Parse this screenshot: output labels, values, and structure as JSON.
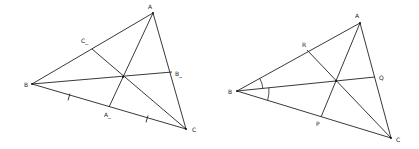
{
  "figures": [
    {
      "name": "medians-triangle",
      "vertices": {
        "A": {
          "label": "A",
          "x": 153,
          "y": 13,
          "lx": 148,
          "ly": 9
        },
        "B": {
          "label": "B",
          "x": 32,
          "y": 84,
          "lx": 24,
          "ly": 87
        },
        "C": {
          "label": "C",
          "x": 186,
          "y": 129,
          "lx": 192,
          "ly": 132
        }
      },
      "feet": {
        "A_": {
          "label": "A_",
          "x": 109,
          "y": 107,
          "lx": 104,
          "ly": 117
        },
        "B_": {
          "label": "B_",
          "x": 172,
          "y": 72,
          "lx": 175,
          "ly": 76
        },
        "C_": {
          "label": "C_",
          "x": 92,
          "y": 49,
          "lx": 81,
          "ly": 43
        }
      },
      "center": {
        "x": 123,
        "y": 77
      },
      "tick_marks": [
        {
          "x": 69,
          "y": 97
        },
        {
          "x": 147,
          "y": 119
        }
      ]
    },
    {
      "name": "angle-bisectors-triangle",
      "vertices": {
        "A": {
          "label": "A",
          "x": 360,
          "y": 23,
          "lx": 355,
          "ly": 18
        },
        "B": {
          "label": "B",
          "x": 237,
          "y": 91,
          "lx": 228,
          "ly": 94
        },
        "C": {
          "label": "C",
          "x": 391,
          "y": 138,
          "lx": 396,
          "ly": 142
        }
      },
      "feet": {
        "P": {
          "label": "P",
          "x": 321,
          "y": 117,
          "lx": 316,
          "ly": 126
        },
        "Q": {
          "label": "Q",
          "x": 375,
          "y": 77,
          "lx": 379,
          "ly": 80
        },
        "R": {
          "label": "R",
          "x": 307,
          "y": 50,
          "lx": 302,
          "ly": 47
        }
      },
      "center": {
        "x": 336,
        "y": 81
      },
      "angle_arcs": [
        {
          "from": "BA",
          "to": "BQ",
          "radius": 26
        },
        {
          "from": "BQ",
          "to": "BC",
          "radius": 32
        }
      ]
    }
  ]
}
